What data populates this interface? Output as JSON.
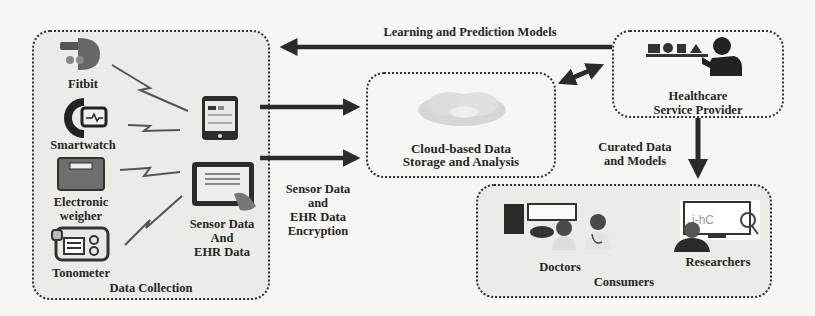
{
  "diagram": {
    "colors": {
      "background": "#f6f6f4",
      "box_fill": "#ebebe8",
      "arrow": "#2b2b2b",
      "box_border": "#333333"
    },
    "data_collection": {
      "label": "Data Collection",
      "devices": [
        {
          "label": "Fitbit",
          "icon": "fitbit-icon"
        },
        {
          "label": "Smartwatch",
          "icon": "smartwatch-icon"
        },
        {
          "label_line1": "Electronic",
          "label_line2": "weigher",
          "icon": "scale-icon"
        },
        {
          "label": "Tonometer",
          "icon": "tonometer-icon"
        }
      ],
      "hubs": [
        {
          "icon": "smartphone-icon"
        },
        {
          "icon": "tablet-icon"
        }
      ],
      "hub_label_line1": "Sensor Data",
      "hub_label_line2": "And",
      "hub_label_line3": "EHR Data"
    },
    "encryption_label": {
      "line1": "Sensor Data",
      "line2": "and",
      "line3": "EHR Data",
      "line4": "Encryption"
    },
    "cloud": {
      "label_line1": "Cloud-based Data",
      "label_line2": "Storage and Analysis",
      "icon": "cloud-icon"
    },
    "provider": {
      "label_line1": "Healthcare",
      "label_line2": "Service Provider",
      "icon": "service-provider-icon"
    },
    "feedback_label": "Learning and Prediction Models",
    "curated_label": {
      "line1": "Curated Data",
      "line2": "and Models"
    },
    "consumers": {
      "label": "Consumers",
      "groups": [
        {
          "label": "Doctors",
          "icon": "doctors-icon"
        },
        {
          "label": "Researchers",
          "icon": "researcher-icon"
        }
      ]
    }
  }
}
